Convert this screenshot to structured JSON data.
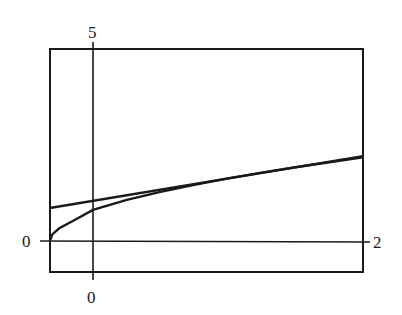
{
  "chart_data": {
    "type": "line",
    "title": "",
    "xlabel": "",
    "ylabel": "",
    "xlim": [
      -0.32,
      2
    ],
    "ylim": [
      -0.8,
      5
    ],
    "x_tick_labels": [
      "0",
      "2"
    ],
    "y_tick_labels": [
      "0",
      "5"
    ],
    "grid": false,
    "legend": null,
    "series": [
      {
        "name": "curve",
        "x": [
          -0.32,
          -0.3,
          -0.25,
          -0.15,
          0,
          0.25,
          0.5,
          0.75,
          1.0,
          1.25,
          1.5,
          1.75,
          2.0
        ],
        "y": [
          0.0,
          0.18,
          0.33,
          0.52,
          0.81,
          1.07,
          1.28,
          1.46,
          1.63,
          1.78,
          1.92,
          2.05,
          2.18
        ]
      },
      {
        "name": "tangent-line",
        "x": [
          -0.32,
          2.0
        ],
        "y": [
          0.86,
          2.21
        ]
      }
    ]
  },
  "labels": {
    "y_top": "5",
    "y_zero": "0",
    "x_zero": "0",
    "x_right": "2"
  },
  "colors": {
    "ink": "#1a1a1a",
    "background": "#ffffff"
  }
}
